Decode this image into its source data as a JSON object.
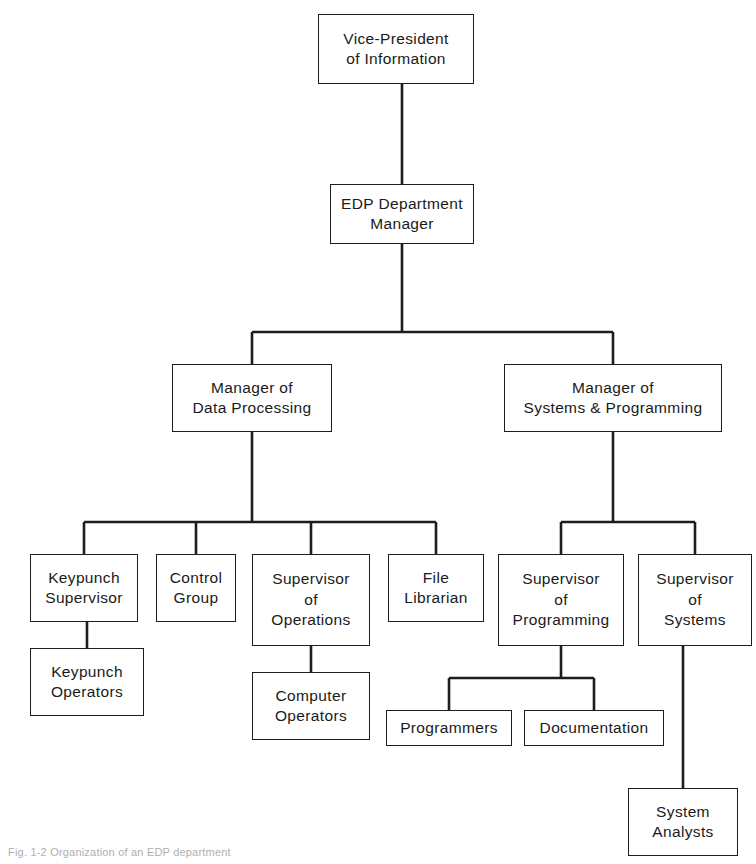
{
  "chart_data": {
    "type": "diagram",
    "diagram_type": "organization-chart",
    "orientation": "top-down",
    "nodes": [
      {
        "id": "vp",
        "lines": [
          "Vice-President",
          "of Information"
        ],
        "x": 318,
        "y": 14,
        "w": 156,
        "h": 70
      },
      {
        "id": "edp",
        "lines": [
          "EDP Department",
          "Manager"
        ],
        "x": 330,
        "y": 184,
        "w": 144,
        "h": 60
      },
      {
        "id": "mgr_dp",
        "lines": [
          "Manager of",
          "Data Processing"
        ],
        "x": 172,
        "y": 364,
        "w": 160,
        "h": 68
      },
      {
        "id": "mgr_sp",
        "lines": [
          "Manager of",
          "Systems & Programming"
        ],
        "x": 504,
        "y": 364,
        "w": 218,
        "h": 68
      },
      {
        "id": "keypunch_sup",
        "lines": [
          "Keypunch",
          "Supervisor"
        ],
        "x": 30,
        "y": 554,
        "w": 108,
        "h": 68
      },
      {
        "id": "control",
        "lines": [
          "Control",
          "Group"
        ],
        "x": 156,
        "y": 554,
        "w": 80,
        "h": 68
      },
      {
        "id": "sup_ops",
        "lines": [
          "Supervisor",
          "of",
          "Operations"
        ],
        "x": 252,
        "y": 554,
        "w": 118,
        "h": 92
      },
      {
        "id": "file_lib",
        "lines": [
          "File",
          "Librarian"
        ],
        "x": 388,
        "y": 554,
        "w": 96,
        "h": 68
      },
      {
        "id": "sup_prog",
        "lines": [
          "Supervisor",
          "of",
          "Programming"
        ],
        "x": 498,
        "y": 554,
        "w": 126,
        "h": 92
      },
      {
        "id": "sup_sys",
        "lines": [
          "Supervisor",
          "of",
          "Systems"
        ],
        "x": 638,
        "y": 554,
        "w": 114,
        "h": 92
      },
      {
        "id": "keypunch_op",
        "lines": [
          "Keypunch",
          "Operators"
        ],
        "x": 30,
        "y": 648,
        "w": 114,
        "h": 68
      },
      {
        "id": "computer_op",
        "lines": [
          "Computer",
          "Operators"
        ],
        "x": 252,
        "y": 672,
        "w": 118,
        "h": 68
      },
      {
        "id": "programmers",
        "lines": [
          "Programmers"
        ],
        "x": 386,
        "y": 710,
        "w": 126,
        "h": 36
      },
      {
        "id": "documentation",
        "lines": [
          "Documentation"
        ],
        "x": 524,
        "y": 710,
        "w": 140,
        "h": 36
      },
      {
        "id": "sys_analysts",
        "lines": [
          "System",
          "Analysts"
        ],
        "x": 628,
        "y": 788,
        "w": 110,
        "h": 68
      }
    ],
    "edges": [
      {
        "from": "vp",
        "to": "edp",
        "style": "vertical"
      },
      {
        "from": "edp",
        "to": "mgr_dp",
        "style": "bus"
      },
      {
        "from": "edp",
        "to": "mgr_sp",
        "style": "bus"
      },
      {
        "from": "mgr_dp",
        "to": "keypunch_sup",
        "style": "bus"
      },
      {
        "from": "mgr_dp",
        "to": "control",
        "style": "bus"
      },
      {
        "from": "mgr_dp",
        "to": "sup_ops",
        "style": "bus"
      },
      {
        "from": "mgr_dp",
        "to": "file_lib",
        "style": "bus"
      },
      {
        "from": "mgr_sp",
        "to": "sup_prog",
        "style": "bus"
      },
      {
        "from": "mgr_sp",
        "to": "sup_sys",
        "style": "bus"
      },
      {
        "from": "keypunch_sup",
        "to": "keypunch_op",
        "style": "vertical"
      },
      {
        "from": "sup_ops",
        "to": "computer_op",
        "style": "vertical"
      },
      {
        "from": "sup_prog",
        "to": "programmers",
        "style": "bus"
      },
      {
        "from": "sup_prog",
        "to": "documentation",
        "style": "bus"
      },
      {
        "from": "sup_sys",
        "to": "sys_analysts",
        "style": "vertical"
      }
    ],
    "line_color": "#1d1d1d",
    "box_fill": "#ffffff",
    "background": "#ffffff"
  },
  "caption": {
    "text": "Fig. 1-2  Organization of an EDP department"
  }
}
